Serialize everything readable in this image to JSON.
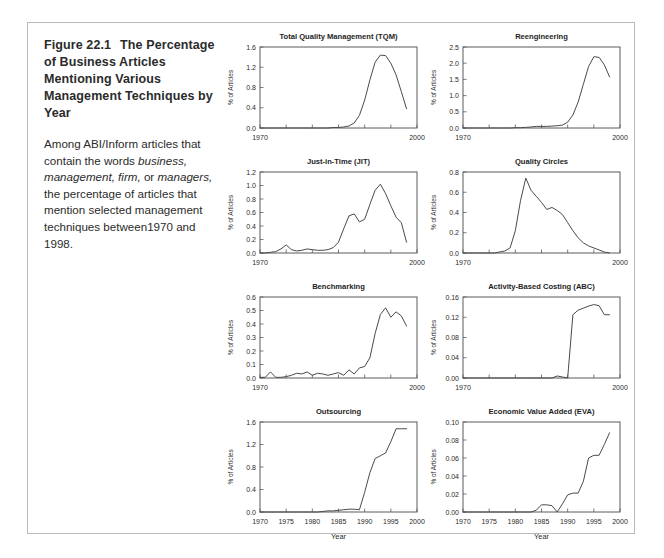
{
  "figure": {
    "number": "Figure 22.1",
    "heading": "The Percentage of Business Articles Mentioning Various Management Techniques by Year",
    "caption_part1": "Among ABI/Inform articles that contain the words ",
    "caption_italic1": "business, management, firm,",
    "caption_part2": " or ",
    "caption_italic2": "managers,",
    "caption_part3": " the percentage of articles that mention selected management techniques between1970 and 1998."
  },
  "axis": {
    "ylabel": "% of Articles",
    "xlabel": "Year",
    "x_short_ticks": [
      "1970",
      "2000"
    ],
    "x_full_ticks": [
      "1970",
      "1975",
      "1980",
      "1985",
      "1990",
      "1995",
      "2000"
    ],
    "xlim": [
      1970,
      2000
    ]
  },
  "chart_data": [
    {
      "type": "line",
      "title": "Total Quality Management (TQM)",
      "xlabel": "",
      "ylabel": "% of Articles",
      "xlim": [
        1970,
        2000
      ],
      "ylim": [
        0.0,
        1.6
      ],
      "yticks": [
        "0.0",
        "0.4",
        "0.8",
        "1.2",
        "1.6"
      ],
      "xticks": [
        "1970",
        "2000"
      ],
      "grid": false,
      "x": [
        1970,
        1971,
        1972,
        1973,
        1974,
        1975,
        1976,
        1977,
        1978,
        1979,
        1980,
        1981,
        1982,
        1983,
        1984,
        1985,
        1986,
        1987,
        1988,
        1989,
        1990,
        1991,
        1992,
        1993,
        1994,
        1995,
        1996,
        1997,
        1998
      ],
      "values": [
        0.0,
        0.0,
        0.0,
        0.0,
        0.0,
        0.0,
        0.0,
        0.0,
        0.0,
        0.0,
        0.0,
        0.0,
        0.0,
        0.0,
        0.01,
        0.01,
        0.02,
        0.04,
        0.1,
        0.25,
        0.55,
        0.95,
        1.3,
        1.44,
        1.43,
        1.28,
        1.05,
        0.72,
        0.38
      ]
    },
    {
      "type": "line",
      "title": "Reengineering",
      "xlabel": "",
      "ylabel": "% of Articles",
      "xlim": [
        1970,
        2000
      ],
      "ylim": [
        0.0,
        2.5
      ],
      "yticks": [
        "0.0",
        "0.5",
        "1.0",
        "1.5",
        "2.0",
        "2.5"
      ],
      "xticks": [
        "1970",
        "2000"
      ],
      "grid": false,
      "x": [
        1970,
        1971,
        1972,
        1973,
        1974,
        1975,
        1976,
        1977,
        1978,
        1979,
        1980,
        1981,
        1982,
        1983,
        1984,
        1985,
        1986,
        1987,
        1988,
        1989,
        1990,
        1991,
        1992,
        1993,
        1994,
        1995,
        1996,
        1997,
        1998
      ],
      "values": [
        0.0,
        0.0,
        0.0,
        0.0,
        0.0,
        0.0,
        0.0,
        0.0,
        0.0,
        0.0,
        0.01,
        0.01,
        0.02,
        0.03,
        0.05,
        0.05,
        0.05,
        0.06,
        0.07,
        0.09,
        0.18,
        0.4,
        0.8,
        1.35,
        1.9,
        2.2,
        2.18,
        1.95,
        1.58
      ]
    },
    {
      "type": "line",
      "title": "Just-in-Time (JIT)",
      "xlabel": "",
      "ylabel": "% of Articles",
      "xlim": [
        1970,
        2000
      ],
      "ylim": [
        0.0,
        1.2
      ],
      "yticks": [
        "0.0",
        "0.2",
        "0.4",
        "0.6",
        "0.8",
        "1.0",
        "1.2"
      ],
      "xticks": [
        "1970",
        "2000"
      ],
      "grid": false,
      "x": [
        1970,
        1971,
        1972,
        1973,
        1974,
        1975,
        1976,
        1977,
        1978,
        1979,
        1980,
        1981,
        1982,
        1983,
        1984,
        1985,
        1986,
        1987,
        1988,
        1989,
        1990,
        1991,
        1992,
        1993,
        1994,
        1995,
        1996,
        1997,
        1998
      ],
      "values": [
        0.0,
        0.0,
        0.01,
        0.02,
        0.06,
        0.12,
        0.05,
        0.03,
        0.04,
        0.06,
        0.05,
        0.04,
        0.04,
        0.05,
        0.08,
        0.16,
        0.36,
        0.55,
        0.58,
        0.46,
        0.5,
        0.72,
        0.93,
        1.02,
        0.88,
        0.7,
        0.53,
        0.45,
        0.16
      ]
    },
    {
      "type": "line",
      "title": "Quality Circles",
      "xlabel": "",
      "ylabel": "% of Articles",
      "xlim": [
        1970,
        2000
      ],
      "ylim": [
        0.0,
        0.8
      ],
      "yticks": [
        "0.0",
        "0.2",
        "0.4",
        "0.6",
        "0.8"
      ],
      "xticks": [
        "1970",
        "2000"
      ],
      "grid": false,
      "x": [
        1970,
        1971,
        1972,
        1973,
        1974,
        1975,
        1976,
        1977,
        1978,
        1979,
        1980,
        1981,
        1982,
        1983,
        1984,
        1985,
        1986,
        1987,
        1988,
        1989,
        1990,
        1991,
        1992,
        1993,
        1994,
        1995,
        1996,
        1997,
        1998
      ],
      "values": [
        0.0,
        0.0,
        0.0,
        0.0,
        0.0,
        0.0,
        0.0,
        0.01,
        0.02,
        0.05,
        0.22,
        0.52,
        0.74,
        0.62,
        0.56,
        0.5,
        0.43,
        0.45,
        0.42,
        0.38,
        0.3,
        0.22,
        0.15,
        0.1,
        0.07,
        0.05,
        0.03,
        0.01,
        0.0
      ]
    },
    {
      "type": "line",
      "title": "Benchmarking",
      "xlabel": "",
      "ylabel": "% of Articles",
      "xlim": [
        1970,
        2000
      ],
      "ylim": [
        0.0,
        0.6
      ],
      "yticks": [
        "0.0",
        "0.1",
        "0.2",
        "0.3",
        "0.4",
        "0.5",
        "0.6"
      ],
      "xticks": [
        "1970",
        "2000"
      ],
      "grid": false,
      "x": [
        1970,
        1971,
        1972,
        1973,
        1974,
        1975,
        1976,
        1977,
        1978,
        1979,
        1980,
        1981,
        1982,
        1983,
        1984,
        1985,
        1986,
        1987,
        1988,
        1989,
        1990,
        1991,
        1992,
        1993,
        1994,
        1995,
        1996,
        1997,
        1998
      ],
      "values": [
        0.005,
        0.005,
        0.045,
        0.005,
        0.005,
        0.01,
        0.02,
        0.035,
        0.03,
        0.045,
        0.02,
        0.035,
        0.03,
        0.02,
        0.03,
        0.04,
        0.02,
        0.06,
        0.03,
        0.075,
        0.085,
        0.15,
        0.33,
        0.47,
        0.52,
        0.45,
        0.49,
        0.46,
        0.385
      ]
    },
    {
      "type": "line",
      "title": "Activity-Based Costing (ABC)",
      "xlabel": "",
      "ylabel": "% of Articles",
      "xlim": [
        1970,
        2000
      ],
      "ylim": [
        0.0,
        0.16
      ],
      "yticks": [
        "0.00",
        "0.04",
        "0.08",
        "0.12",
        "0.16"
      ],
      "xticks": [
        "1970",
        "2000"
      ],
      "grid": false,
      "x": [
        1970,
        1971,
        1972,
        1973,
        1974,
        1975,
        1976,
        1977,
        1978,
        1979,
        1980,
        1981,
        1982,
        1983,
        1984,
        1985,
        1986,
        1987,
        1988,
        1989,
        1990,
        1991,
        1992,
        1993,
        1994,
        1995,
        1996,
        1997,
        1998
      ],
      "values": [
        0.0,
        0.0,
        0.0,
        0.0,
        0.0,
        0.0,
        0.0,
        0.0,
        0.0,
        0.0,
        0.0,
        0.0,
        0.0,
        0.0,
        0.0,
        0.0,
        0.0,
        0.0,
        0.004,
        0.002,
        0.0,
        0.125,
        0.134,
        0.138,
        0.142,
        0.145,
        0.143,
        0.125,
        0.125
      ]
    },
    {
      "type": "line",
      "title": "Outsourcing",
      "xlabel": "Year",
      "ylabel": "% of Articles",
      "xlim": [
        1970,
        2000
      ],
      "ylim": [
        0.0,
        1.6
      ],
      "yticks": [
        "0.0",
        "0.4",
        "0.8",
        "1.2",
        "1.6"
      ],
      "xticks": [
        "1970",
        "1975",
        "1980",
        "1985",
        "1990",
        "1995",
        "2000"
      ],
      "grid": false,
      "x": [
        1970,
        1971,
        1972,
        1973,
        1974,
        1975,
        1976,
        1977,
        1978,
        1979,
        1980,
        1981,
        1982,
        1983,
        1984,
        1985,
        1986,
        1987,
        1988,
        1989,
        1990,
        1991,
        1992,
        1993,
        1994,
        1995,
        1996,
        1997,
        1998
      ],
      "values": [
        0.0,
        0.0,
        0.0,
        0.0,
        0.0,
        0.0,
        0.0,
        0.0,
        0.0,
        0.0,
        0.0,
        0.0,
        0.01,
        0.02,
        0.02,
        0.03,
        0.04,
        0.05,
        0.05,
        0.04,
        0.35,
        0.7,
        0.95,
        1.0,
        1.05,
        1.25,
        1.48,
        1.48,
        1.48
      ]
    },
    {
      "type": "line",
      "title": "Economic Value Added (EVA)",
      "xlabel": "Year",
      "ylabel": "% of Articles",
      "xlim": [
        1970,
        2000
      ],
      "ylim": [
        0.0,
        0.1
      ],
      "yticks": [
        "0.00",
        "0.02",
        "0.04",
        "0.06",
        "0.08",
        "0.10"
      ],
      "xticks": [
        "1970",
        "1975",
        "1980",
        "1985",
        "1990",
        "1995",
        "2000"
      ],
      "grid": false,
      "x": [
        1970,
        1971,
        1972,
        1973,
        1974,
        1975,
        1976,
        1977,
        1978,
        1979,
        1980,
        1981,
        1982,
        1983,
        1984,
        1985,
        1986,
        1987,
        1988,
        1989,
        1990,
        1991,
        1992,
        1993,
        1994,
        1995,
        1996,
        1997,
        1998
      ],
      "values": [
        0.0,
        0.0,
        0.0,
        0.0,
        0.0,
        0.0,
        0.0,
        0.0,
        0.0,
        0.0,
        0.0,
        0.0,
        0.0,
        0.0,
        0.002,
        0.008,
        0.008,
        0.007,
        0.0,
        0.009,
        0.019,
        0.021,
        0.021,
        0.034,
        0.06,
        0.063,
        0.063,
        0.075,
        0.088
      ]
    }
  ]
}
